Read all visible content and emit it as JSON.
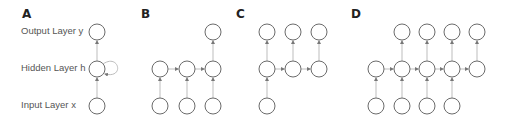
{
  "colors": {
    "node_stroke": "#6b6b6b",
    "edge": "#bdbdbd",
    "arrow": "#777777",
    "text": "#555555"
  },
  "panels": [
    {
      "id": "A",
      "label": "A",
      "x": 22,
      "y": 7
    },
    {
      "id": "B",
      "label": "B",
      "x": 141,
      "y": 7
    },
    {
      "id": "C",
      "label": "C",
      "x": 236,
      "y": 7
    },
    {
      "id": "D",
      "label": "D",
      "x": 351,
      "y": 7
    }
  ],
  "layer_labels": {
    "output": "Output Layer y",
    "hidden": "Hidden Layer h",
    "input": "Input Layer x"
  },
  "rows": {
    "output_y": 32,
    "hidden_y": 69,
    "input_y": 106
  },
  "node_radius": 8,
  "diagram": {
    "A": {
      "description": "one-to-one with recurrent self-loop",
      "hidden_x": [
        97
      ],
      "input_x": [
        97
      ],
      "output_x": [
        97
      ],
      "self_loop": true
    },
    "B": {
      "description": "many-to-one",
      "hidden_x": [
        160,
        187,
        213
      ],
      "input_x": [
        160,
        187,
        213
      ],
      "output_x": [
        213
      ]
    },
    "C": {
      "description": "one-to-many",
      "hidden_x": [
        267,
        293,
        319
      ],
      "input_x": [
        267
      ],
      "output_x": [
        267,
        293,
        319
      ]
    },
    "D": {
      "description": "many-to-many",
      "hidden_x": [
        376,
        402,
        427,
        452,
        477
      ],
      "input_x": [
        376,
        402,
        427,
        452
      ],
      "output_x": [
        402,
        427,
        452,
        477
      ]
    }
  }
}
